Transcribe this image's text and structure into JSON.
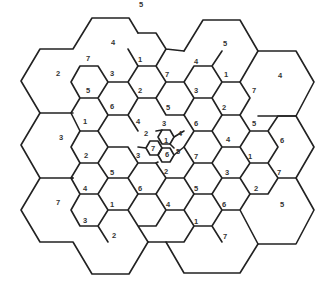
{
  "diagram": {
    "title": "",
    "type": "hexagonal-cell-frequency-reuse",
    "line_color": "#222222",
    "background": "#ffffff",
    "labels": [
      {
        "text": "5",
        "x": 141,
        "y": 5
      },
      {
        "text": "4",
        "x": 113,
        "y": 43
      },
      {
        "text": "5",
        "x": 225,
        "y": 44
      },
      {
        "text": "2",
        "x": 58,
        "y": 74
      },
      {
        "text": "7",
        "x": 88,
        "y": 59
      },
      {
        "text": "1",
        "x": 140,
        "y": 60
      },
      {
        "text": "4",
        "x": 196,
        "y": 62
      },
      {
        "text": "3",
        "x": 112,
        "y": 74
      },
      {
        "text": "7",
        "x": 167,
        "y": 75
      },
      {
        "text": "1",
        "x": 226,
        "y": 75
      },
      {
        "text": "4",
        "x": 280,
        "y": 76
      },
      {
        "text": "5",
        "x": 88,
        "y": 91
      },
      {
        "text": "2",
        "x": 140,
        "y": 91
      },
      {
        "text": "3",
        "x": 196,
        "y": 91
      },
      {
        "text": "7",
        "x": 254,
        "y": 91
      },
      {
        "text": "6",
        "x": 112,
        "y": 107
      },
      {
        "text": "5",
        "x": 168,
        "y": 108
      },
      {
        "text": "2",
        "x": 224,
        "y": 108
      },
      {
        "text": "1",
        "x": 85,
        "y": 122
      },
      {
        "text": "4",
        "x": 138,
        "y": 122
      },
      {
        "text": "3",
        "x": 164,
        "y": 124
      },
      {
        "text": "6",
        "x": 196,
        "y": 124
      },
      {
        "text": "5",
        "x": 254,
        "y": 124
      },
      {
        "text": "2",
        "x": 146,
        "y": 134
      },
      {
        "text": "4",
        "x": 180,
        "y": 134
      },
      {
        "text": "3",
        "x": 61,
        "y": 138
      },
      {
        "text": "1",
        "x": 166,
        "y": 141
      },
      {
        "text": "4",
        "x": 228,
        "y": 140
      },
      {
        "text": "6",
        "x": 282,
        "y": 141
      },
      {
        "text": "7",
        "x": 153,
        "y": 149
      },
      {
        "text": "5",
        "x": 178,
        "y": 152
      },
      {
        "text": "6",
        "x": 167,
        "y": 155
      },
      {
        "text": "2",
        "x": 86,
        "y": 156
      },
      {
        "text": "3",
        "x": 138,
        "y": 156
      },
      {
        "text": "7",
        "x": 196,
        "y": 157
      },
      {
        "text": "1",
        "x": 250,
        "y": 157
      },
      {
        "text": "5",
        "x": 112,
        "y": 173
      },
      {
        "text": "2",
        "x": 166,
        "y": 172
      },
      {
        "text": "3",
        "x": 227,
        "y": 173
      },
      {
        "text": "7",
        "x": 279,
        "y": 173
      },
      {
        "text": "4",
        "x": 85,
        "y": 189
      },
      {
        "text": "6",
        "x": 140,
        "y": 189
      },
      {
        "text": "5",
        "x": 196,
        "y": 189
      },
      {
        "text": "2",
        "x": 256,
        "y": 189
      },
      {
        "text": "7",
        "x": 58,
        "y": 203
      },
      {
        "text": "1",
        "x": 112,
        "y": 205
      },
      {
        "text": "4",
        "x": 168,
        "y": 205
      },
      {
        "text": "6",
        "x": 224,
        "y": 205
      },
      {
        "text": "5",
        "x": 282,
        "y": 205
      },
      {
        "text": "3",
        "x": 85,
        "y": 221
      },
      {
        "text": "1",
        "x": 196,
        "y": 222
      },
      {
        "text": "2",
        "x": 114,
        "y": 236
      },
      {
        "text": "7",
        "x": 225,
        "y": 237
      }
    ]
  }
}
